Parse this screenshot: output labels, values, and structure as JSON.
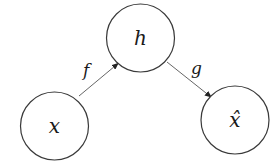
{
  "diagram": {
    "title": "",
    "nodes": [
      {
        "id": "x",
        "label": "x",
        "cx": 54.5,
        "cy": 126,
        "r": 34
      },
      {
        "id": "h",
        "label": "h",
        "cx": 140.5,
        "cy": 38,
        "r": 34
      },
      {
        "id": "xhat",
        "label": "x̂",
        "cx": 235,
        "cy": 120,
        "r": 34
      }
    ],
    "edges": [
      {
        "id": "f",
        "from": "x",
        "to": "h",
        "label": "f"
      },
      {
        "id": "g",
        "from": "h",
        "to": "xhat",
        "label": "g"
      }
    ],
    "colors": {
      "stroke": "#3a3a3a",
      "edge": "#555555",
      "text": "#1a1a1a",
      "background": "#ffffff"
    }
  }
}
